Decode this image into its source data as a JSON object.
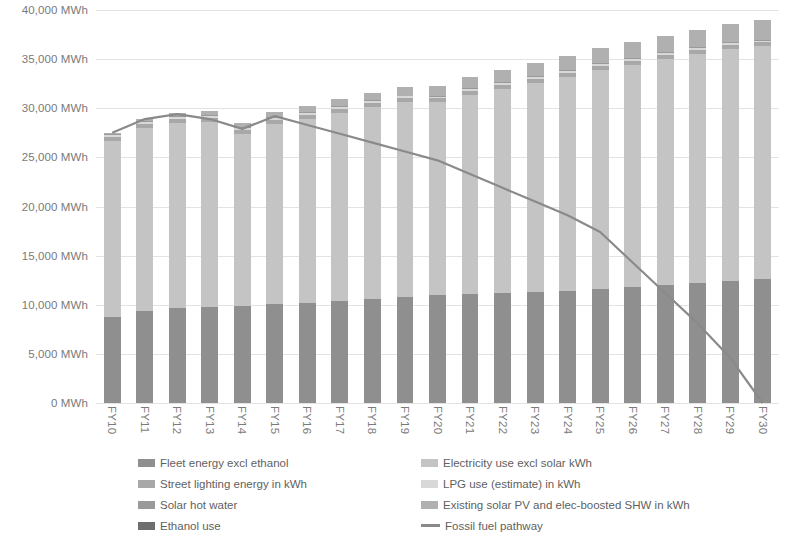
{
  "chart_data": {
    "type": "bar",
    "title": "",
    "xlabel": "",
    "ylabel": "",
    "ylim": [
      0,
      40000
    ],
    "ytick_step": 5000,
    "grid": true,
    "legend_position": "bottom",
    "unit": "MWh",
    "categories": [
      "FY10",
      "FY11",
      "FY12",
      "FY13",
      "FY14",
      "FY15",
      "FY16",
      "FY17",
      "FY18",
      "FY19",
      "FY20",
      "FY21",
      "FY22",
      "FY23",
      "FY24",
      "FY25",
      "FY26",
      "FY27",
      "FY28",
      "FY29",
      "FY30"
    ],
    "ytick_labels": [
      "0 MWh",
      "5,000 MWh",
      "10,000 MWh",
      "15,000 MWh",
      "20,000 MWh",
      "25,000 MWh",
      "30,000 MWh",
      "35,000 MWh",
      "40,000 MWh"
    ],
    "ytick_values": [
      0,
      5000,
      10000,
      15000,
      20000,
      25000,
      30000,
      35000,
      40000
    ],
    "series": [
      {
        "name": "Fleet energy excl ethanol",
        "color": "#8f8f8f",
        "stack": true,
        "values": [
          8800,
          9400,
          9700,
          9800,
          9900,
          10100,
          10200,
          10400,
          10600,
          10800,
          11000,
          11100,
          11200,
          11300,
          11400,
          11600,
          11800,
          12000,
          12200,
          12400,
          12600
        ]
      },
      {
        "name": "Electricity use excl solar kWh",
        "color": "#c4c4c4",
        "stack": true,
        "values": [
          17900,
          18600,
          18800,
          18800,
          17500,
          18300,
          18700,
          19100,
          19500,
          19800,
          19600,
          20300,
          20800,
          21300,
          21800,
          22300,
          22600,
          23000,
          23300,
          23600,
          23700
        ]
      },
      {
        "name": "Street lighting energy in kWh",
        "color": "#a8a8a8",
        "stack": true,
        "values": [
          400,
          400,
          400,
          400,
          400,
          400,
          400,
          400,
          400,
          400,
          400,
          400,
          400,
          400,
          400,
          400,
          400,
          400,
          400,
          400,
          400
        ]
      },
      {
        "name": "LPG use (estimate) in kWh",
        "color": "#d8d8d8",
        "stack": true,
        "values": [
          200,
          200,
          200,
          200,
          200,
          200,
          200,
          200,
          200,
          200,
          200,
          200,
          200,
          200,
          200,
          200,
          200,
          200,
          200,
          200,
          200
        ]
      },
      {
        "name": "Solar hot water",
        "color": "#9a9a9a",
        "stack": true,
        "values": [
          100,
          100,
          100,
          100,
          100,
          100,
          100,
          100,
          100,
          100,
          100,
          100,
          100,
          100,
          100,
          100,
          100,
          100,
          100,
          100,
          100
        ]
      },
      {
        "name": "Existing solar PV and elec-boosted SHW in kWh",
        "color": "#b0b0b0",
        "stack": true,
        "values": [
          100,
          200,
          300,
          400,
          400,
          500,
          600,
          700,
          800,
          900,
          1000,
          1100,
          1200,
          1300,
          1400,
          1500,
          1600,
          1700,
          1800,
          1900,
          2000
        ]
      },
      {
        "name": "Ethanol use",
        "color": "#6e6e6e",
        "stack": true,
        "values": [
          0,
          0,
          0,
          0,
          0,
          0,
          0,
          0,
          0,
          0,
          0,
          0,
          0,
          0,
          0,
          0,
          0,
          0,
          0,
          0,
          0
        ]
      }
    ],
    "line_series": {
      "name": "Fossil fuel pathway",
      "color": "#8a8a8a",
      "values": [
        27500,
        28900,
        29400,
        28900,
        27900,
        29200,
        28300,
        27400,
        26500,
        25600,
        24700,
        23300,
        21900,
        20500,
        19100,
        17400,
        14300,
        11200,
        8100,
        4600,
        0
      ]
    }
  },
  "legend": {
    "left_column": [
      {
        "label": "Fleet energy excl ethanol",
        "color": "#8f8f8f",
        "marker": "swatch"
      },
      {
        "label": "Street lighting energy in kWh",
        "color": "#a8a8a8",
        "marker": "swatch"
      },
      {
        "label": "Solar hot water",
        "color": "#9a9a9a",
        "marker": "swatch"
      },
      {
        "label": "Ethanol use",
        "color": "#6e6e6e",
        "marker": "swatch"
      }
    ],
    "right_column": [
      {
        "label": "Electricity use excl solar kWh",
        "color": "#c4c4c4",
        "marker": "swatch"
      },
      {
        "label": "LPG use (estimate) in kWh",
        "color": "#d8d8d8",
        "marker": "swatch"
      },
      {
        "label": "Existing solar PV and elec-boosted SHW in kWh",
        "color": "#b0b0b0",
        "marker": "swatch"
      },
      {
        "label": "Fossil fuel pathway",
        "color": "#8a8a8a",
        "marker": "line"
      }
    ]
  },
  "colors": {
    "gridline": "#e3e3e3",
    "axis_text": "#7a7a7a",
    "legend_text": "#5f5f5f",
    "background": "#ffffff"
  }
}
